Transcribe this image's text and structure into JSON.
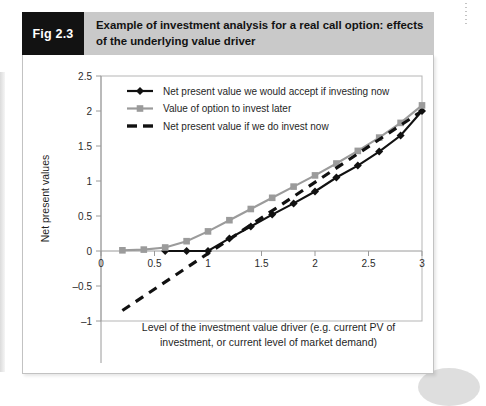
{
  "figure": {
    "tag": "Fig 2.3",
    "title": "Example of investment analysis for a real call option: effects of the underlying value driver"
  },
  "colors": {
    "tag_background": "#121212",
    "tag_text": "#ffffff",
    "header_background": "#c9c9c9",
    "card_background": "#ffffff",
    "card_border": "#c2c2c2",
    "series_npv_now": "#111111",
    "series_option": "#9b9b9b",
    "series_dashed": "#111111",
    "axis": "#9a9a9a",
    "plot_border": "#b5b5b5"
  },
  "chart_data": {
    "type": "line",
    "title": "",
    "xlabel": "Level of the investment value driver (e.g. current PV of investment, or current level of market demand)",
    "xlabel_lines": [
      "Level of the investment value driver (e.g. current PV of",
      "investment, or current level of market demand)"
    ],
    "ylabel": "Net present values",
    "xlim": [
      0,
      3
    ],
    "ylim": [
      -1,
      2.5
    ],
    "xticks": [
      0,
      0.5,
      1,
      1.5,
      2,
      2.5,
      3
    ],
    "xtick_labels": [
      "0",
      "0.5",
      "1",
      "1.5",
      "2",
      "2.5",
      "3"
    ],
    "yticks": [
      -1,
      -0.5,
      0,
      0.5,
      1,
      1.5,
      2,
      2.5
    ],
    "ytick_labels": [
      "–1",
      "–0.5",
      "0",
      "0.5",
      "1",
      "1.5",
      "2",
      "2.5"
    ],
    "grid": false,
    "legend_position": "top-left-inside",
    "series": [
      {
        "name": "Net present value we would accept if investing now",
        "color": "#111111",
        "marker": "diamond",
        "style": "solid",
        "x": [
          0.6,
          0.8,
          1.0,
          1.2,
          1.4,
          1.6,
          1.8,
          2.0,
          2.2,
          2.4,
          2.6,
          2.8,
          3.0
        ],
        "y": [
          0.0,
          0.0,
          0.0,
          0.18,
          0.35,
          0.52,
          0.68,
          0.85,
          1.05,
          1.22,
          1.42,
          1.65,
          2.0
        ]
      },
      {
        "name": "Value of option to invest later",
        "color": "#9b9b9b",
        "marker": "square",
        "style": "solid",
        "x": [
          0.2,
          0.4,
          0.6,
          0.8,
          1.0,
          1.2,
          1.4,
          1.6,
          1.8,
          2.0,
          2.2,
          2.4,
          2.6,
          2.8,
          3.0
        ],
        "y": [
          0.01,
          0.02,
          0.05,
          0.14,
          0.28,
          0.44,
          0.6,
          0.76,
          0.92,
          1.08,
          1.25,
          1.43,
          1.62,
          1.83,
          2.08
        ]
      },
      {
        "name": "Net present value if we do invest now",
        "color": "#111111",
        "marker": "none",
        "style": "dashed",
        "x": [
          0.2,
          3.0
        ],
        "y": [
          -0.85,
          2.0
        ]
      }
    ],
    "legend": [
      {
        "label": "Net present value we would accept if investing now",
        "color": "#111111",
        "marker": "diamond",
        "style": "solid"
      },
      {
        "label": "Value of option to invest later",
        "color": "#9b9b9b",
        "marker": "square",
        "style": "solid"
      },
      {
        "label": "Net present value if we do invest now",
        "color": "#111111",
        "marker": "none",
        "style": "dashed"
      }
    ]
  }
}
